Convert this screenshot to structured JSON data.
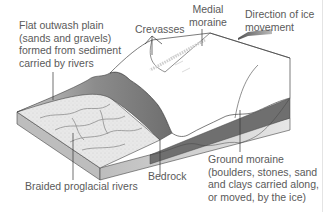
{
  "figure": {
    "type": "glacial landforms block diagram",
    "labels": {
      "outwash_plain": [
        "Flat outwash plain",
        "(sands and gravels)",
        "formed from sediment",
        "carried by rivers"
      ],
      "crevasses": "Crevasses",
      "medial_moraine": [
        "Medial",
        "moraine"
      ],
      "ice_direction": [
        "Direction of ice",
        "movement"
      ],
      "ground_moraine": [
        "Ground moraine",
        "(boulders, stones, sand",
        "and clays carried along,",
        "or moved, by the ice)"
      ],
      "bedrock": "Bedrock",
      "braided_rivers": "Braided proglacial rivers"
    },
    "colors": {
      "text": "#5a5a5a",
      "leader_line": "#333333",
      "ice": "#ffffff",
      "ice_outline": "#444444",
      "outwash_surface": "#e6e6e6",
      "bedrock_front": "#d9d9d9",
      "moraine_dark": "#7a7a7a",
      "arrow": "#777777"
    }
  }
}
